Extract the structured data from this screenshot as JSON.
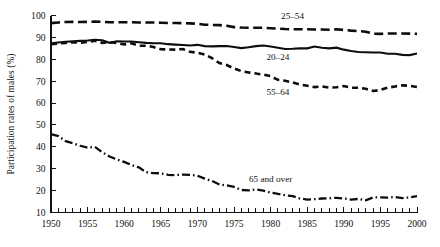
{
  "chart_data": {
    "type": "line",
    "title": "",
    "xlabel": "",
    "ylabel": "Participation rates of males (%)",
    "xlim": [
      1950,
      2000
    ],
    "ylim": [
      10,
      100
    ],
    "grid": false,
    "legend_position": "inline-annotations",
    "xticks": [
      1950,
      1955,
      1960,
      1965,
      1970,
      1975,
      1980,
      1985,
      1990,
      1995,
      2000
    ],
    "xtick_labels": [
      "1950",
      "1955",
      "1960",
      "1965",
      "1970",
      "1975",
      "1980",
      "1985",
      "1990",
      "1995",
      "2000"
    ],
    "minor_xtick_interval": 1,
    "yticks": [
      10,
      20,
      30,
      40,
      50,
      60,
      70,
      80,
      90,
      100
    ],
    "ytick_labels": [
      "10",
      "20",
      "30",
      "40",
      "50",
      "60",
      "70",
      "80",
      "90",
      "100"
    ],
    "x": [
      1950,
      1951,
      1952,
      1953,
      1954,
      1955,
      1956,
      1957,
      1958,
      1959,
      1960,
      1961,
      1962,
      1963,
      1964,
      1965,
      1966,
      1967,
      1968,
      1969,
      1970,
      1971,
      1972,
      1973,
      1974,
      1975,
      1976,
      1977,
      1978,
      1979,
      1980,
      1981,
      1982,
      1983,
      1984,
      1985,
      1986,
      1987,
      1988,
      1989,
      1990,
      1991,
      1992,
      1993,
      1994,
      1995,
      1996,
      1997,
      1998,
      1999,
      2000
    ],
    "series": [
      {
        "name": "25-54",
        "label": "25–54",
        "style": "long-dash",
        "label_x": 1983,
        "label_y": 98.5,
        "values": [
          96.5,
          96.8,
          97.0,
          97.1,
          97.0,
          97.1,
          97.2,
          97.1,
          96.9,
          96.9,
          96.9,
          96.9,
          96.8,
          96.8,
          96.8,
          96.7,
          96.6,
          96.6,
          96.5,
          96.4,
          96.2,
          95.8,
          95.7,
          95.6,
          95.3,
          94.7,
          94.5,
          94.4,
          94.4,
          94.4,
          94.2,
          94.0,
          93.8,
          93.7,
          93.7,
          93.7,
          93.6,
          93.6,
          93.5,
          93.7,
          93.4,
          93.1,
          92.9,
          92.6,
          91.7,
          91.6,
          91.8,
          91.8,
          91.8,
          91.7,
          91.6
        ]
      },
      {
        "name": "20-24",
        "label": "20–24",
        "style": "solid",
        "label_x": 1981,
        "label_y": 79.5,
        "values": [
          87.3,
          87.7,
          88.0,
          88.2,
          88.4,
          88.6,
          88.9,
          88.7,
          87.5,
          88.2,
          88.1,
          88.1,
          87.8,
          87.5,
          87.3,
          87.3,
          86.9,
          86.7,
          86.5,
          86.3,
          86.6,
          86.0,
          85.9,
          86.0,
          86.1,
          85.6,
          85.1,
          85.5,
          86.0,
          86.3,
          85.8,
          85.3,
          84.7,
          84.8,
          85.0,
          85.0,
          85.8,
          85.3,
          85.0,
          85.3,
          84.4,
          83.8,
          83.3,
          83.2,
          83.1,
          83.1,
          82.5,
          82.5,
          82.0,
          81.9,
          82.6
        ]
      },
      {
        "name": "55-64",
        "label": "55–64",
        "style": "short-dash",
        "label_x": 1981,
        "label_y": 63.5,
        "values": [
          86.9,
          87.2,
          87.5,
          87.8,
          87.5,
          87.9,
          88.5,
          87.5,
          87.8,
          87.4,
          86.8,
          87.3,
          86.2,
          86.2,
          85.6,
          84.6,
          84.5,
          84.4,
          84.7,
          83.4,
          83.0,
          82.2,
          80.5,
          78.3,
          77.4,
          75.8,
          74.6,
          74.0,
          73.5,
          73.0,
          72.3,
          70.6,
          70.2,
          69.4,
          68.5,
          67.9,
          67.3,
          67.6,
          67.0,
          67.2,
          67.8,
          67.0,
          67.0,
          66.5,
          65.5,
          66.0,
          67.0,
          67.6,
          68.1,
          67.9,
          67.3
        ]
      },
      {
        "name": "65 and over",
        "label": "65 and over",
        "style": "dash-dot",
        "label_x": 1980,
        "label_y": 24.0,
        "values": [
          45.8,
          44.9,
          42.6,
          41.6,
          40.5,
          39.6,
          40.0,
          37.5,
          35.6,
          34.2,
          33.1,
          31.7,
          30.6,
          28.4,
          28.0,
          27.9,
          27.2,
          27.1,
          27.3,
          27.2,
          26.8,
          25.5,
          24.4,
          22.8,
          22.4,
          21.7,
          20.3,
          20.1,
          20.5,
          20.0,
          19.1,
          18.5,
          17.9,
          17.5,
          16.4,
          15.9,
          16.1,
          16.4,
          16.5,
          16.7,
          16.4,
          15.9,
          16.2,
          15.6,
          16.9,
          16.9,
          16.8,
          17.1,
          16.6,
          16.9,
          17.5
        ]
      }
    ]
  },
  "figure": {
    "ylabel": "Participation rates of males (%)"
  }
}
